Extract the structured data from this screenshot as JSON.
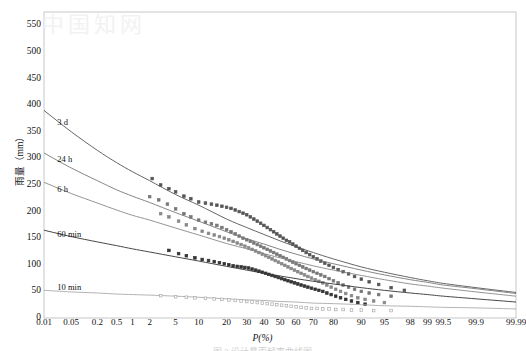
{
  "figure": {
    "watermark_text": "中国知网",
    "caption": "图 3  设计暴雨频率曲线图",
    "background": "#ffffff",
    "plot_border_color": "#b9b9b9"
  },
  "axes": {
    "y": {
      "label": "雨量（mm）",
      "ticks": [
        0,
        50,
        100,
        150,
        200,
        250,
        300,
        350,
        400,
        450,
        500,
        550
      ],
      "min": 0,
      "max": 575,
      "grid": false
    },
    "x": {
      "label": "P(%)",
      "ticks": [
        "0.01",
        "0.05",
        "0.2",
        "0.5",
        "1",
        "2",
        "5",
        "10",
        "20",
        "30",
        "40",
        "50",
        "60",
        "70",
        "80",
        "90",
        "95",
        "98",
        "99",
        "99.5",
        "99.9",
        "99.99"
      ],
      "scale": "probability",
      "min": 0.01,
      "max": 99.99,
      "grid": false
    }
  },
  "chart_data": {
    "type": "line",
    "title": "",
    "subtitle": "",
    "xlabel": "P(%)",
    "ylabel": "雨量（mm）",
    "xlim": [
      0.01,
      99.99
    ],
    "ylim": [
      0,
      575
    ],
    "xscale": "probability",
    "grid": false,
    "legend_position": "inline-curve-labels",
    "annotations": [
      {
        "text": "3 d",
        "p": 0.02,
        "value": 368
      },
      {
        "text": "24 h",
        "p": 0.02,
        "value": 298
      },
      {
        "text": "6 h",
        "p": 0.02,
        "value": 243
      },
      {
        "text": "60 min",
        "p": 0.02,
        "value": 157
      },
      {
        "text": "10 min",
        "p": 0.02,
        "value": 58
      }
    ],
    "series": [
      {
        "name": "3 d",
        "color": "#555555",
        "marker": "square",
        "curve_x": [
          0.01,
          0.05,
          0.2,
          0.5,
          1,
          2,
          5,
          10,
          20,
          30,
          40,
          50,
          60,
          70,
          80,
          90,
          95,
          98,
          99,
          99.5,
          99.9,
          99.99
        ],
        "curve_y": [
          390,
          350,
          315,
          292,
          275,
          258,
          232,
          212,
          186,
          170,
          157,
          145,
          134,
          123,
          111,
          96,
          86,
          76,
          70,
          65,
          57,
          48
        ],
        "points_x": [
          2.2,
          3.0,
          4.0,
          5.0,
          6.5,
          8.0,
          10,
          12,
          14,
          16,
          18,
          20,
          22,
          24,
          26,
          28,
          30,
          32,
          34,
          36,
          38,
          40,
          42,
          44,
          46,
          48,
          50,
          52,
          54,
          56,
          58,
          60,
          62,
          64,
          66,
          68,
          70,
          72,
          74,
          76,
          78,
          80,
          82,
          84,
          86,
          88,
          90,
          92,
          94,
          96,
          97.5
        ],
        "points_y": [
          262,
          250,
          243,
          237,
          229,
          224,
          218,
          216,
          214,
          212,
          210,
          208,
          206,
          203,
          200,
          197,
          194,
          190,
          186,
          182,
          178,
          174,
          170,
          166,
          162,
          158,
          154,
          150,
          146,
          143,
          139,
          135,
          131,
          127,
          123,
          119,
          115,
          111,
          107,
          103,
          99,
          95,
          91,
          87,
          83,
          78,
          73,
          68,
          63,
          57,
          52
        ]
      },
      {
        "name": "24 h",
        "color": "#777777",
        "marker": "square",
        "curve_x": [
          0.01,
          0.05,
          0.2,
          0.5,
          1,
          2,
          5,
          10,
          20,
          30,
          40,
          50,
          60,
          70,
          80,
          90,
          95,
          98,
          99,
          99.5,
          99.9,
          99.99
        ],
        "curve_y": [
          310,
          282,
          258,
          241,
          229,
          217,
          198,
          182,
          162,
          149,
          139,
          129,
          120,
          111,
          102,
          90,
          81,
          72,
          67,
          62,
          55,
          46
        ],
        "points_x": [
          2.0,
          2.8,
          3.8,
          5.0,
          6.5,
          8.0,
          10,
          12,
          14,
          16,
          18,
          20,
          22,
          24,
          26,
          28,
          30,
          32,
          34,
          36,
          38,
          40,
          42,
          44,
          46,
          48,
          50,
          52,
          54,
          56,
          58,
          60,
          62,
          64,
          66,
          68,
          70,
          72,
          74,
          76,
          78,
          80,
          82,
          84,
          86,
          88,
          90,
          92,
          94,
          96
        ],
        "points_y": [
          228,
          222,
          214,
          205,
          196,
          190,
          184,
          180,
          177,
          174,
          170,
          166,
          162,
          158,
          154,
          150,
          147,
          144,
          141,
          138,
          135,
          132,
          129,
          126,
          123,
          120,
          117,
          114,
          111,
          108,
          105,
          102,
          99,
          96,
          93,
          90,
          87,
          84,
          81,
          78,
          74,
          70,
          66,
          62,
          58,
          54,
          50,
          47,
          44,
          41
        ]
      },
      {
        "name": "6 h",
        "color": "#888888",
        "marker": "square",
        "curve_x": [
          0.01,
          0.05,
          0.2,
          0.5,
          1,
          2,
          5,
          10,
          20,
          30,
          40,
          50,
          60,
          70,
          80,
          90,
          95,
          98,
          99,
          99.5,
          99.9,
          99.99
        ],
        "curve_y": [
          255,
          234,
          216,
          203,
          193,
          184,
          169,
          156,
          140,
          130,
          121,
          113,
          106,
          98,
          90,
          80,
          72,
          64,
          60,
          56,
          49,
          41
        ],
        "points_x": [
          3.0,
          4.0,
          5.5,
          7.0,
          9.0,
          11,
          13,
          15,
          17,
          19,
          21,
          23,
          25,
          27,
          29,
          31,
          33,
          35,
          37,
          39,
          41,
          43,
          45,
          47,
          49,
          51,
          53,
          55,
          57,
          59,
          61,
          63,
          65,
          67,
          69,
          71,
          73,
          75,
          77,
          79,
          81,
          83,
          85,
          87,
          89,
          91,
          93,
          95
        ],
        "points_y": [
          196,
          190,
          182,
          175,
          168,
          163,
          159,
          156,
          153,
          150,
          147,
          144,
          141,
          138,
          135,
          132,
          129,
          126,
          123,
          120,
          117,
          114,
          111,
          108,
          105,
          102,
          99,
          96,
          93,
          90,
          87,
          84,
          81,
          78,
          75,
          72,
          69,
          66,
          62,
          58,
          54,
          50,
          46,
          42,
          38,
          35,
          32,
          29
        ]
      },
      {
        "name": "60 min",
        "color": "#333333",
        "marker": "square",
        "curve_x": [
          0.01,
          0.05,
          0.2,
          0.5,
          1,
          2,
          5,
          10,
          20,
          30,
          40,
          50,
          60,
          70,
          80,
          90,
          95,
          98,
          99,
          99.5,
          99.9,
          99.99
        ],
        "curve_y": [
          165,
          153,
          143,
          136,
          130,
          124,
          115,
          107,
          97,
          90,
          84,
          79,
          74,
          69,
          64,
          57,
          52,
          47,
          44,
          41,
          36,
          30
        ],
        "points_x": [
          4.0,
          5.5,
          7.0,
          9.0,
          11,
          13,
          15,
          17,
          19,
          21,
          23,
          25,
          27,
          29,
          31,
          33,
          35,
          37,
          39,
          41,
          43,
          45,
          47,
          49,
          51,
          53,
          55,
          57,
          59,
          61,
          63,
          65,
          67,
          69,
          71,
          73,
          75,
          77,
          79,
          81,
          83,
          85,
          87,
          89,
          91
        ],
        "points_y": [
          127,
          121,
          117,
          113,
          110,
          108,
          106,
          104,
          102,
          100,
          98,
          97,
          96,
          95,
          94,
          92,
          90,
          88,
          86,
          84,
          82,
          80,
          78,
          76,
          74,
          72,
          70,
          68,
          66,
          64,
          62,
          60,
          58,
          56,
          54,
          52,
          50,
          47,
          44,
          41,
          38,
          35,
          32,
          29,
          26
        ]
      },
      {
        "name": "10 min",
        "color": "#aaaaaa",
        "marker": "square-open",
        "curve_x": [
          0.01,
          0.05,
          0.2,
          0.5,
          1,
          2,
          5,
          10,
          20,
          30,
          40,
          50,
          60,
          70,
          80,
          90,
          95,
          98,
          99,
          99.5,
          99.9,
          99.99
        ],
        "curve_y": [
          52,
          49,
          47,
          45,
          44,
          43,
          41,
          39,
          36,
          34,
          33,
          31,
          30,
          28,
          27,
          25,
          23,
          22,
          21,
          20,
          19,
          17
        ],
        "points_x": [
          3.0,
          5.0,
          7.0,
          9.0,
          12,
          15,
          18,
          21,
          24,
          27,
          30,
          33,
          36,
          39,
          42,
          45,
          48,
          51,
          54,
          57,
          60,
          63,
          66,
          69,
          72,
          75,
          78,
          81,
          84,
          87,
          90,
          93,
          96
        ],
        "points_y": [
          42,
          40,
          39,
          38,
          37,
          36,
          35,
          34,
          33,
          32,
          31,
          30,
          29,
          28,
          27,
          26,
          25,
          24,
          23,
          22,
          21,
          20,
          19,
          18,
          18,
          17,
          17,
          16,
          16,
          15,
          15,
          14,
          14
        ]
      }
    ]
  }
}
